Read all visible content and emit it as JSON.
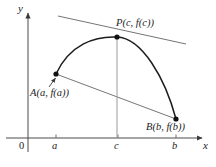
{
  "figure": {
    "background_color": "#ffffff",
    "ink_color": "#232323",
    "line_color": "#6b6b6b",
    "curve_color": "#1a1a1a"
  },
  "axes": {
    "y_axis_label": "y",
    "x_axis_label": "x",
    "origin_label": "0",
    "x_ticks": [
      {
        "id": "tick-a",
        "label": "a",
        "x": 56
      },
      {
        "id": "tick-c",
        "label": "c",
        "x": 118
      },
      {
        "id": "tick-b",
        "label": "b",
        "x": 176
      }
    ],
    "x_axis_y": 138,
    "y_axis_x": 28
  },
  "points": [
    {
      "id": "point-P",
      "label": "P(c, f(c))",
      "x": 117,
      "y": 37
    },
    {
      "id": "point-A",
      "label": "A(a, f(a))",
      "x": 56,
      "y": 74
    },
    {
      "id": "point-B",
      "label": "B(b, f(b))",
      "x": 176,
      "y": 119
    }
  ],
  "lines": {
    "tangent": {
      "name": "tangent-line-at-P",
      "x1": 58,
      "y1": 16,
      "x2": 186,
      "y2": 44
    },
    "secant": {
      "name": "secant-line-AB",
      "x1": 56,
      "y1": 74,
      "x2": 176,
      "y2": 119
    },
    "vertical_c": {
      "name": "vertical-drop-at-c",
      "x": 117,
      "y1": 37,
      "y2": 138
    },
    "leader_A": {
      "name": "leader-arrow-to-A",
      "x1": 50,
      "y1": 86,
      "x2": 57,
      "y2": 77
    }
  },
  "curve": {
    "name": "function-curve",
    "path": "M 56 74 C 70 44, 95 36, 117 37 C 142 38, 165 78, 176 119"
  }
}
